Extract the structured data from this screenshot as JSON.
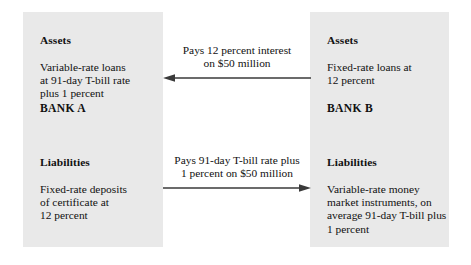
{
  "figure": {
    "background_color": "#ffffff",
    "box_fill_color": "#e9e9e9",
    "text_color": "#111111",
    "arrow_color": "#3a3a3a"
  },
  "bank_a": {
    "name_label": "BANK A",
    "assets": {
      "heading": "Assets",
      "body": "Variable-rate loans\nat 91-day T-bill rate\nplus 1 percent"
    },
    "liabilities": {
      "heading": "Liabilities",
      "body": "Fixed-rate deposits\nof certificate at\n12 percent"
    }
  },
  "bank_b": {
    "name_label": "BANK B",
    "assets": {
      "heading": "Assets",
      "body": "Fixed-rate loans at\n12 percent"
    },
    "liabilities": {
      "heading": "Liabilities",
      "body": "Variable-rate money\nmarket instruments, on\naverage 91-day T-bill plus\n1 percent"
    }
  },
  "flows": {
    "top": {
      "caption": "Pays 12 percent interest\non $50 million",
      "direction": "left",
      "icon": "arrow-left-icon"
    },
    "bottom": {
      "caption": "Pays 91-day T-bill rate plus\n1 percent on $50 million",
      "direction": "right",
      "icon": "arrow-right-icon"
    }
  }
}
